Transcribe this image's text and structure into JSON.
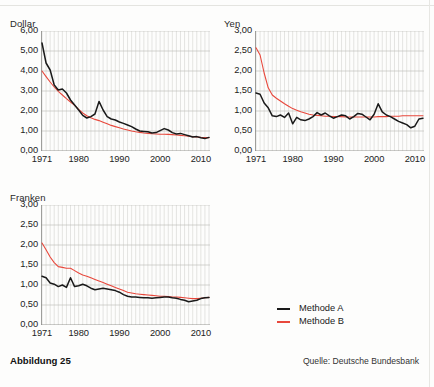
{
  "figure": {
    "caption": "Abbildung 25",
    "source": "Quelle: Deutsche Bundesbank"
  },
  "legend": {
    "items": [
      {
        "label": "Methode A",
        "color": "#1a1a1a"
      },
      {
        "label": "Methode B",
        "color": "#e8483c"
      }
    ]
  },
  "colors": {
    "method_a": "#1a1a1a",
    "method_b": "#e8483c",
    "gridline": "#b8b8b4",
    "yearline": "#cfcfcb",
    "axis": "#8a8a86",
    "background": "#fdfdfc"
  },
  "chart_data": [
    {
      "type": "line",
      "title": "Dollar",
      "xlabel": "",
      "ylabel": "",
      "xlim": [
        1971,
        2012
      ],
      "ylim": [
        0,
        6
      ],
      "yticks": [
        "0,00",
        "1,00",
        "2,00",
        "3,00",
        "4,00",
        "5,00",
        "6,00"
      ],
      "ytick_values": [
        0,
        1,
        2,
        3,
        4,
        5,
        6
      ],
      "xticks": [
        "1971",
        "1980",
        "1990",
        "2000",
        "2010"
      ],
      "xtick_values": [
        1971,
        1980,
        1990,
        2000,
        2010
      ],
      "grid": "horizontal gridlines at each ytick; thin vertical gridline each year",
      "legend_position": "external-right-below",
      "x": [
        1971,
        1972,
        1973,
        1974,
        1975,
        1976,
        1977,
        1978,
        1979,
        1980,
        1981,
        1982,
        1983,
        1984,
        1985,
        1986,
        1987,
        1988,
        1989,
        1990,
        1991,
        1992,
        1993,
        1994,
        1995,
        1996,
        1997,
        1998,
        1999,
        2000,
        2001,
        2002,
        2003,
        2004,
        2005,
        2006,
        2007,
        2008,
        2009,
        2010,
        2011,
        2012
      ],
      "series": [
        {
          "name": "Methode A",
          "color": "#1a1a1a",
          "values": [
            5.4,
            4.4,
            4.05,
            3.3,
            3.05,
            3.1,
            2.9,
            2.55,
            2.3,
            2.05,
            1.78,
            1.65,
            1.72,
            1.85,
            2.48,
            2.05,
            1.72,
            1.6,
            1.55,
            1.45,
            1.38,
            1.3,
            1.22,
            1.1,
            1.0,
            0.98,
            0.96,
            0.9,
            0.92,
            1.02,
            1.12,
            1.05,
            0.92,
            0.85,
            0.88,
            0.82,
            0.76,
            0.7,
            0.72,
            0.66,
            0.62,
            0.68
          ]
        },
        {
          "name": "Methode B",
          "color": "#e8483c",
          "values": [
            4.0,
            3.72,
            3.45,
            3.2,
            2.98,
            2.8,
            2.62,
            2.45,
            2.28,
            2.08,
            1.9,
            1.76,
            1.66,
            1.58,
            1.52,
            1.44,
            1.36,
            1.28,
            1.22,
            1.16,
            1.1,
            1.05,
            1.0,
            0.96,
            0.93,
            0.9,
            0.88,
            0.86,
            0.85,
            0.84,
            0.84,
            0.83,
            0.82,
            0.8,
            0.78,
            0.76,
            0.74,
            0.72,
            0.7,
            0.68,
            0.67,
            0.67
          ]
        }
      ]
    },
    {
      "type": "line",
      "title": "Yen",
      "xlabel": "",
      "ylabel": "",
      "xlim": [
        1971,
        2012
      ],
      "ylim": [
        0,
        3
      ],
      "yticks": [
        "0,00",
        "0,50",
        "1,00",
        "1,50",
        "2,00",
        "2,50",
        "3,00"
      ],
      "ytick_values": [
        0,
        0.5,
        1,
        1.5,
        2,
        2.5,
        3
      ],
      "xticks": [
        "1971",
        "1980",
        "1990",
        "2000",
        "2010"
      ],
      "xtick_values": [
        1971,
        1980,
        1990,
        2000,
        2010
      ],
      "grid": "horizontal gridlines at each ytick; thin vertical gridline each year",
      "legend_position": "external-right-below",
      "x": [
        1971,
        1972,
        1973,
        1974,
        1975,
        1976,
        1977,
        1978,
        1979,
        1980,
        1981,
        1982,
        1983,
        1984,
        1985,
        1986,
        1987,
        1988,
        1989,
        1990,
        1991,
        1992,
        1993,
        1994,
        1995,
        1996,
        1997,
        1998,
        1999,
        2000,
        2001,
        2002,
        2003,
        2004,
        2005,
        2006,
        2007,
        2008,
        2009,
        2010,
        2011,
        2012
      ],
      "series": [
        {
          "name": "Methode A",
          "color": "#1a1a1a",
          "values": [
            1.45,
            1.42,
            1.2,
            1.08,
            0.88,
            0.86,
            0.9,
            0.84,
            0.95,
            0.68,
            0.84,
            0.78,
            0.76,
            0.8,
            0.86,
            0.96,
            0.9,
            0.95,
            0.88,
            0.82,
            0.86,
            0.9,
            0.88,
            0.8,
            0.86,
            0.94,
            0.92,
            0.85,
            0.78,
            0.92,
            1.18,
            0.98,
            0.9,
            0.86,
            0.8,
            0.74,
            0.7,
            0.66,
            0.58,
            0.62,
            0.8,
            0.82
          ]
        },
        {
          "name": "Methode B",
          "color": "#e8483c",
          "values": [
            2.58,
            2.4,
            1.95,
            1.58,
            1.4,
            1.32,
            1.25,
            1.18,
            1.12,
            1.06,
            1.02,
            0.98,
            0.95,
            0.92,
            0.9,
            0.89,
            0.88,
            0.87,
            0.87,
            0.86,
            0.86,
            0.86,
            0.85,
            0.85,
            0.85,
            0.85,
            0.85,
            0.85,
            0.85,
            0.85,
            0.86,
            0.86,
            0.86,
            0.87,
            0.87,
            0.87,
            0.88,
            0.88,
            0.88,
            0.88,
            0.88,
            0.88
          ]
        }
      ]
    },
    {
      "type": "line",
      "title": "Franken",
      "xlabel": "",
      "ylabel": "",
      "xlim": [
        1971,
        2012
      ],
      "ylim": [
        0,
        3
      ],
      "yticks": [
        "0,00",
        "0,50",
        "1,00",
        "1,50",
        "2,00",
        "2,50",
        "3,00"
      ],
      "ytick_values": [
        0,
        0.5,
        1,
        1.5,
        2,
        2.5,
        3
      ],
      "xticks": [
        "1971",
        "1980",
        "1990",
        "2000",
        "2010"
      ],
      "xtick_values": [
        1971,
        1980,
        1990,
        2000,
        2010
      ],
      "grid": "horizontal gridlines at each ytick; thin vertical gridline each year",
      "legend_position": "external-right-below",
      "x": [
        1971,
        1972,
        1973,
        1974,
        1975,
        1976,
        1977,
        1978,
        1979,
        1980,
        1981,
        1982,
        1983,
        1984,
        1985,
        1986,
        1987,
        1988,
        1989,
        1990,
        1991,
        1992,
        1993,
        1994,
        1995,
        1996,
        1997,
        1998,
        1999,
        2000,
        2001,
        2002,
        2003,
        2004,
        2005,
        2006,
        2007,
        2008,
        2009,
        2010,
        2011,
        2012
      ],
      "series": [
        {
          "name": "Methode A",
          "color": "#1a1a1a",
          "values": [
            1.22,
            1.18,
            1.05,
            1.02,
            0.96,
            1.0,
            0.94,
            1.18,
            0.96,
            0.98,
            1.02,
            0.98,
            0.92,
            0.88,
            0.9,
            0.92,
            0.9,
            0.88,
            0.86,
            0.82,
            0.76,
            0.72,
            0.7,
            0.7,
            0.69,
            0.68,
            0.68,
            0.67,
            0.68,
            0.69,
            0.7,
            0.7,
            0.68,
            0.67,
            0.64,
            0.62,
            0.58,
            0.6,
            0.62,
            0.66,
            0.68,
            0.69
          ]
        },
        {
          "name": "Methode B",
          "color": "#e8483c",
          "values": [
            2.05,
            1.88,
            1.7,
            1.56,
            1.46,
            1.44,
            1.42,
            1.42,
            1.36,
            1.3,
            1.25,
            1.22,
            1.18,
            1.14,
            1.1,
            1.06,
            1.02,
            0.98,
            0.94,
            0.9,
            0.86,
            0.82,
            0.8,
            0.78,
            0.77,
            0.76,
            0.75,
            0.74,
            0.73,
            0.72,
            0.72,
            0.71,
            0.7,
            0.7,
            0.69,
            0.68,
            0.67,
            0.66,
            0.66,
            0.67,
            0.68,
            0.69
          ]
        }
      ]
    }
  ]
}
